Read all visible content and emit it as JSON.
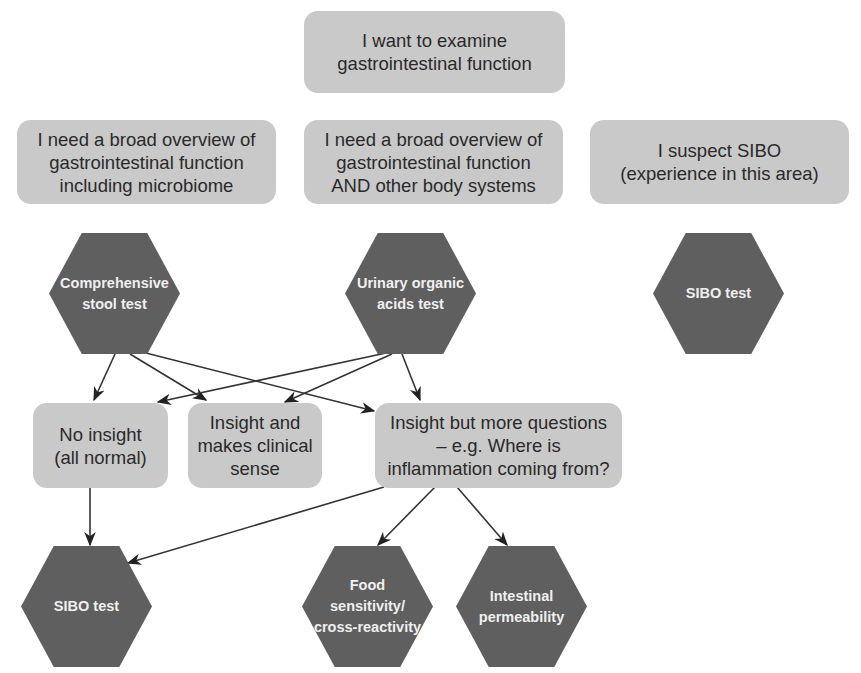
{
  "diagram": {
    "colors": {
      "box_fill": "#c9c9c9",
      "hex_fill": "#5f5f5f",
      "box_text": "#2a2a2a",
      "hex_text": "#f0f0f0",
      "arrow": "#222222"
    },
    "root": {
      "label": "I want to examine\ngastrointestinal function"
    },
    "needs": [
      {
        "label": "I need a broad overview of\ngastrointestinal function\nincluding microbiome"
      },
      {
        "label": "I need a broad overview of\ngastrointestinal function\nAND other body systems"
      },
      {
        "label": "I suspect SIBO\n(experience in this area)"
      }
    ],
    "tests": [
      {
        "label": "Comprehensive\nstool test"
      },
      {
        "label": "Urinary organic\nacids test"
      },
      {
        "label": "SIBO test"
      }
    ],
    "outcomes": [
      {
        "label": "No insight\n(all normal)"
      },
      {
        "label": "Insight and\nmakes clinical\nsense"
      },
      {
        "label": "Insight but more questions\n– e.g. Where is\ninflammation coming from?"
      }
    ],
    "followups": [
      {
        "label": "SIBO test"
      },
      {
        "label": "Food\nsensitivity/\ncross-reactivity"
      },
      {
        "label": "Intestinal\npermeability"
      }
    ],
    "edges": [
      {
        "from": "Comprehensive stool test",
        "to": "No insight (all normal)"
      },
      {
        "from": "Comprehensive stool test",
        "to": "Insight and makes clinical sense"
      },
      {
        "from": "Comprehensive stool test",
        "to": "Insight but more questions"
      },
      {
        "from": "Urinary organic acids test",
        "to": "No insight (all normal)"
      },
      {
        "from": "Urinary organic acids test",
        "to": "Insight and makes clinical sense"
      },
      {
        "from": "Urinary organic acids test",
        "to": "Insight but more questions"
      },
      {
        "from": "No insight (all normal)",
        "to": "SIBO test"
      },
      {
        "from": "Insight but more questions",
        "to": "SIBO test"
      },
      {
        "from": "Insight but more questions",
        "to": "Food sensitivity/cross-reactivity"
      },
      {
        "from": "Insight but more questions",
        "to": "Intestinal permeability"
      }
    ]
  }
}
